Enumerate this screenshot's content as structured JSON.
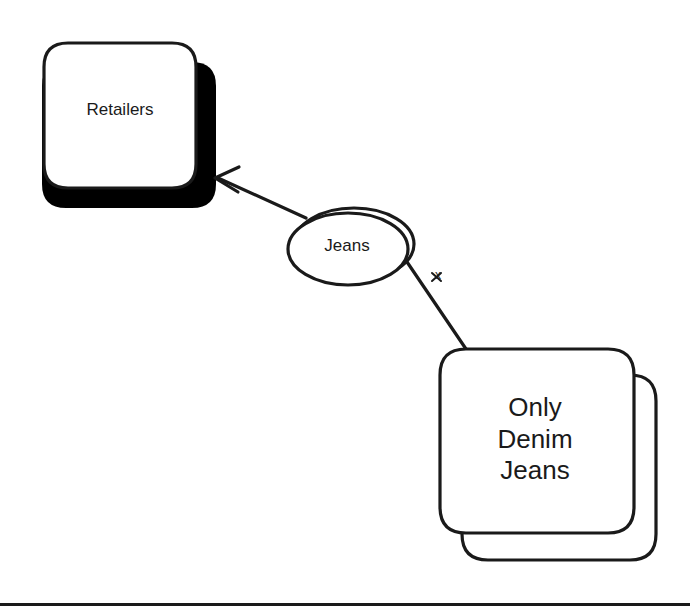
{
  "diagram": {
    "type": "entity-relationship-diagram",
    "background_color": "#ffffff",
    "stroke_color": "#1a1a1a",
    "fill_color": "#ffffff",
    "shadow_color": "#000000",
    "nodes": [
      {
        "id": "retailers",
        "label": "Retailers",
        "shape": "rounded-rectangle-with-drop-shadow",
        "x": 44,
        "y": 42,
        "width": 152,
        "height": 146
      },
      {
        "id": "jeans",
        "label": "Jeans",
        "shape": "double-ellipse",
        "x": 287,
        "y": 210,
        "width": 125,
        "height": 76
      },
      {
        "id": "only-denim-jeans",
        "label": "Only\nDenim\nJeans",
        "shape": "stacked-rounded-rectangle",
        "x": 440,
        "y": 348,
        "width": 193,
        "height": 185
      }
    ],
    "edges": [
      {
        "id": "jeans-to-retailers",
        "from": "jeans",
        "to": "retailers",
        "style": "solid",
        "arrowhead": "open-v",
        "label": ""
      },
      {
        "id": "jeans-to-only-denim-jeans",
        "from": "jeans",
        "to": "only-denim-jeans",
        "style": "solid",
        "arrowhead": "none",
        "label": "x"
      }
    ],
    "footer_rule": {
      "y": 604,
      "thickness": 3,
      "color": "#1a1a1a"
    }
  }
}
